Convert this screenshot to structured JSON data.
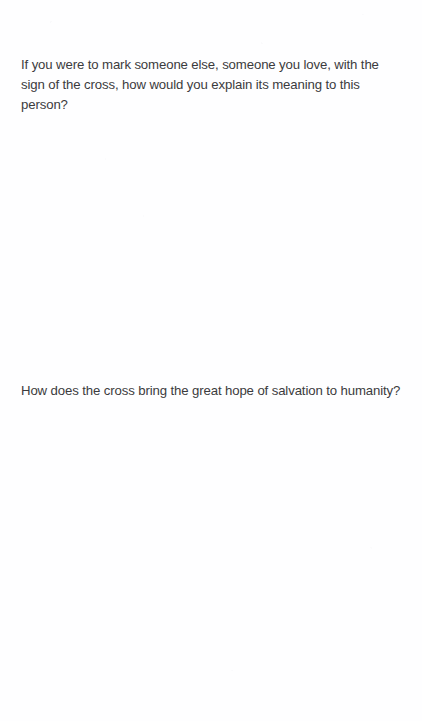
{
  "page": {
    "background_color": "#fefeff",
    "text_color": "#3b3b3d",
    "width": 422,
    "height": 721
  },
  "content": {
    "questions": [
      {
        "id": "question-1",
        "text": "If you were to mark someone else, someone you love, with the sign of the cross, how would you explain its meaning to this person?"
      },
      {
        "id": "question-2",
        "text": "How does the cross bring the great hope of salvation to humanity?"
      }
    ]
  }
}
